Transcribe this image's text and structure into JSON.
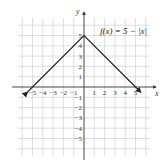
{
  "chart_data": {
    "type": "line",
    "title": "",
    "function_label": "f(x) = 5 − |x|",
    "xlabel": "x",
    "ylabel": "y",
    "xlim": [
      -6,
      6
    ],
    "ylim": [
      -6,
      6
    ],
    "grid": true,
    "x_ticks": [
      -5,
      -4,
      -3,
      -2,
      -1,
      1,
      2,
      3,
      4,
      5
    ],
    "y_ticks": [
      -5,
      -4,
      -3,
      -2,
      -1,
      1,
      2,
      3,
      4,
      5
    ],
    "series": [
      {
        "name": "f(x) = 5 − |x|",
        "x": [
          -5.5,
          -5,
          0,
          5,
          5.5
        ],
        "y": [
          -0.5,
          0,
          5,
          0,
          -0.5
        ],
        "arrows_at_ends": true
      }
    ]
  },
  "labels": {
    "x_axis": "x",
    "y_axis": "y",
    "function": "f(x) = 5 − |x|",
    "x_ticks": [
      "−5",
      "−4",
      "−3",
      "−2",
      "−1",
      "1",
      "2",
      "3",
      "4",
      "5"
    ],
    "y_ticks": [
      "5",
      "4",
      "3",
      "2",
      "1",
      "−1",
      "−2",
      "−3",
      "−4",
      "−5"
    ]
  }
}
